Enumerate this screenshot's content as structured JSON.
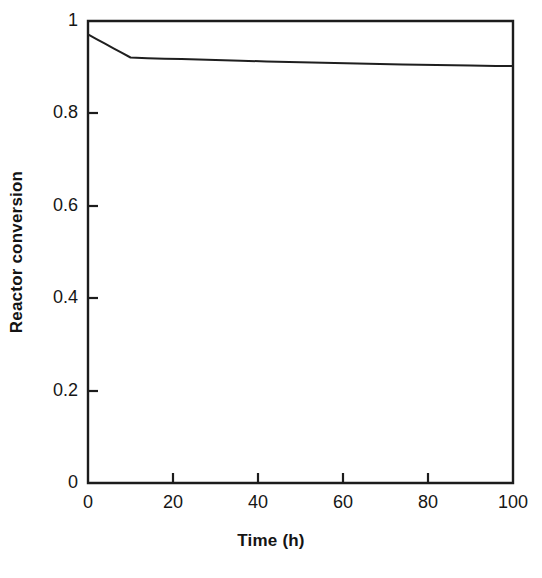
{
  "figure": {
    "background_color": "#ffffff",
    "line_color": "#1f1f1f",
    "axis_color": "#1c1c1c"
  },
  "chart_data": {
    "type": "line",
    "title": "",
    "subtitle": "",
    "xlabel": "Time (h)",
    "ylabel": "Reactor conversion",
    "xlim": [
      0,
      100
    ],
    "ylim": [
      0,
      1
    ],
    "xticks": [
      0,
      20,
      40,
      60,
      80,
      100
    ],
    "yticks": [
      0,
      0.2,
      0.4,
      0.6,
      0.8,
      1
    ],
    "xtick_labels": [
      "0",
      "20",
      "40",
      "60",
      "80",
      "100"
    ],
    "ytick_labels": [
      "0",
      "0.2",
      "0.4",
      "0.6",
      "0.8",
      "1"
    ],
    "grid": false,
    "legend": null,
    "legend_position": "none",
    "annotations": [],
    "series": [
      {
        "name": "Reactor conversion",
        "color": "#1f1f1f",
        "x": [
          0,
          2,
          4,
          6,
          8,
          10,
          14,
          18,
          22,
          26,
          30,
          36,
          42,
          50,
          58,
          66,
          74,
          82,
          90,
          96,
          100
        ],
        "y": [
          0.971,
          0.961,
          0.951,
          0.941,
          0.931,
          0.921,
          0.9195,
          0.9185,
          0.9175,
          0.9165,
          0.9155,
          0.914,
          0.9125,
          0.9105,
          0.909,
          0.9075,
          0.906,
          0.9045,
          0.9035,
          0.9028,
          0.9025
        ]
      }
    ]
  },
  "axis_geometry": {
    "plot_left_px": 88,
    "plot_right_px": 513,
    "plot_top_px": 21,
    "plot_bottom_px": 483
  }
}
